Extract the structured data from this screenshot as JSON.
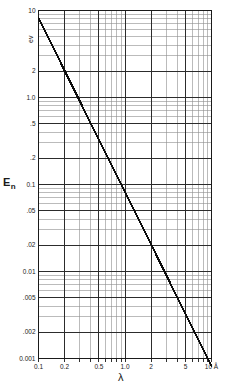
{
  "chart_data": {
    "type": "line",
    "title": "",
    "subtitle": "",
    "xlabel": "λ",
    "ylabel": "E",
    "ylabel_sub": "n",
    "yunit": "ev",
    "xunit": "Å",
    "xscale": "log",
    "yscale": "log",
    "xlim": [
      0.1,
      10
    ],
    "ylim": [
      0.001,
      10
    ],
    "grid": "log-minor",
    "legend": "none",
    "xticks": [
      {
        "value": 0.1,
        "label": "0.1"
      },
      {
        "value": 0.2,
        "label": "0.2"
      },
      {
        "value": 0.5,
        "label": "0.5"
      },
      {
        "value": 1.0,
        "label": "1.0"
      },
      {
        "value": 2.0,
        "label": "2"
      },
      {
        "value": 5.0,
        "label": "5"
      },
      {
        "value": 10.0,
        "label": "10 Å"
      }
    ],
    "yticks": [
      {
        "value": 10,
        "label": "10"
      },
      {
        "value": 2,
        "label": "2"
      },
      {
        "value": 1.0,
        "label": "1.0"
      },
      {
        "value": 0.5,
        "label": ".5"
      },
      {
        "value": 0.2,
        "label": ".2"
      },
      {
        "value": 0.1,
        "label": "0.1"
      },
      {
        "value": 0.05,
        "label": ".05"
      },
      {
        "value": 0.02,
        "label": ".02"
      },
      {
        "value": 0.01,
        "label": "0.01"
      },
      {
        "value": 0.005,
        "label": ".005"
      },
      {
        "value": 0.002,
        "label": ".002"
      },
      {
        "value": 0.001,
        "label": "0.001"
      }
    ],
    "series": [
      {
        "name": "neutron energy vs wavelength",
        "relation": "E = 0.0818 / λ^2",
        "x": [
          0.1,
          0.2,
          0.5,
          1.0,
          2.0,
          5.0,
          9.0,
          10.0
        ],
        "y": [
          8.18,
          2.045,
          0.327,
          0.0818,
          0.0205,
          0.00327,
          0.00101,
          0.000818
        ]
      }
    ]
  },
  "axis_labels": {
    "y_main": "E",
    "y_sub": "n",
    "y_unit": "ev",
    "x_main": "λ"
  }
}
